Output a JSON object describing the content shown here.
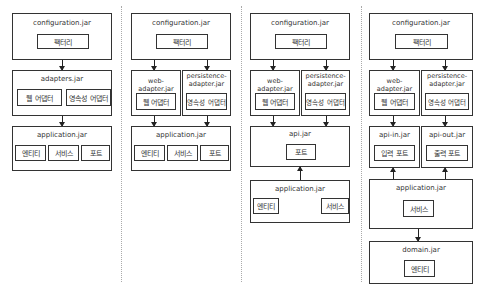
{
  "diagrams": [
    {
      "configuration": {
        "title": "configuration.jar",
        "factory": "팩터리"
      },
      "adapters": {
        "title": "adapters.jar",
        "web_adapter": "웹 어댑터",
        "persistence_adapter": "영속성 어댑터"
      },
      "application": {
        "title": "application.jar",
        "entity": "엔티티",
        "service": "서비스",
        "port": "포트"
      }
    },
    {
      "configuration": {
        "title": "configuration.jar",
        "factory": "팩터리"
      },
      "web_adapter": {
        "title": "web-adapter.jar",
        "inner": "웹 어댑터"
      },
      "persistence_adapter": {
        "title": "persistence-\nadapter.jar",
        "inner": "영속성 어댑터"
      },
      "application": {
        "title": "application.jar",
        "entity": "엔티티",
        "service": "서비스",
        "port": "포트"
      }
    },
    {
      "configuration": {
        "title": "configuration.jar",
        "factory": "팩터리"
      },
      "web_adapter": {
        "title": "web-adapter.jar",
        "inner": "웹 어댑터"
      },
      "persistence_adapter": {
        "title": "persistence-\nadapter.jar",
        "inner": "영속성 어댑터"
      },
      "api": {
        "title": "api.jar",
        "port": "포트"
      },
      "application": {
        "title": "application.jar",
        "entity": "엔티티",
        "service": "서비스"
      }
    },
    {
      "configuration": {
        "title": "configuration.jar",
        "factory": "팩터리"
      },
      "web_adapter": {
        "title": "web-adapter.jar",
        "inner": "웹 어댑터"
      },
      "persistence_adapter": {
        "title": "persistence-\nadapter.jar",
        "inner": "영속성 어댑터"
      },
      "api_in": {
        "title": "api-in.jar",
        "inner": "입력 포트"
      },
      "api_out": {
        "title": "api-out.jar",
        "inner": "출력 포트"
      },
      "application": {
        "title": "application.jar",
        "service": "서비스"
      },
      "domain": {
        "title": "domain.jar",
        "entity": "엔티티"
      }
    }
  ]
}
